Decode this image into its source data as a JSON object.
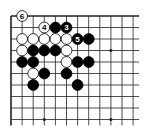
{
  "diagram": {
    "type": "go-board-excerpt",
    "grid": {
      "origin_x": 11,
      "origin_y": 16,
      "spacing_x": 11.1,
      "spacing_y": 11.5,
      "cols": 12,
      "rows": 10,
      "extend_right_px": 6,
      "extend_bottom_px": 6,
      "edges": [
        "top",
        "left"
      ]
    },
    "colors": {
      "line": "#222222",
      "black_stone": "#000000",
      "white_stone": "#ffffff",
      "background": "#ffffff"
    },
    "star_points": [
      {
        "col": 3,
        "row": 3
      },
      {
        "col": 9,
        "row": 3
      },
      {
        "col": 3,
        "row": 9
      },
      {
        "col": 9,
        "row": 9
      }
    ],
    "stones": [
      {
        "col": 1,
        "row": 0,
        "color": "white",
        "label": "6"
      },
      {
        "col": 3,
        "row": 1,
        "color": "white",
        "label": "4"
      },
      {
        "col": 4,
        "row": 1,
        "color": "black",
        "label": ""
      },
      {
        "col": 5,
        "row": 1,
        "color": "black",
        "label": "3"
      },
      {
        "col": 1,
        "row": 2,
        "color": "white",
        "label": ""
      },
      {
        "col": 2,
        "row": 2,
        "color": "white",
        "label": ""
      },
      {
        "col": 3,
        "row": 2,
        "color": "white",
        "label": ""
      },
      {
        "col": 4,
        "row": 2,
        "color": "white",
        "label": ""
      },
      {
        "col": 5,
        "row": 2,
        "color": "white",
        "label": ""
      },
      {
        "col": 6,
        "row": 2,
        "color": "black",
        "label": "5"
      },
      {
        "col": 7,
        "row": 2,
        "color": "black",
        "label": ""
      },
      {
        "col": 1,
        "row": 3,
        "color": "white",
        "label": ""
      },
      {
        "col": 2,
        "row": 3,
        "color": "black",
        "label": ""
      },
      {
        "col": 3,
        "row": 3,
        "color": "black",
        "label": ""
      },
      {
        "col": 4,
        "row": 3,
        "color": "black",
        "label": ""
      },
      {
        "col": 5,
        "row": 3,
        "color": "white",
        "label": ""
      },
      {
        "col": 1,
        "row": 4,
        "color": "black",
        "label": ""
      },
      {
        "col": 2,
        "row": 4,
        "color": "black",
        "label": ""
      },
      {
        "col": 5,
        "row": 4,
        "color": "white",
        "label": ""
      },
      {
        "col": 6,
        "row": 4,
        "color": "black",
        "label": ""
      },
      {
        "col": 7,
        "row": 4,
        "color": "black",
        "label": ""
      },
      {
        "col": 2,
        "row": 5,
        "color": "white",
        "label": ""
      },
      {
        "col": 3,
        "row": 5,
        "color": "black",
        "label": ""
      },
      {
        "col": 5,
        "row": 5,
        "color": "black",
        "label": ""
      },
      {
        "col": 2,
        "row": 6,
        "color": "black",
        "label": ""
      },
      {
        "col": 6,
        "row": 6,
        "color": "black",
        "label": ""
      }
    ]
  }
}
